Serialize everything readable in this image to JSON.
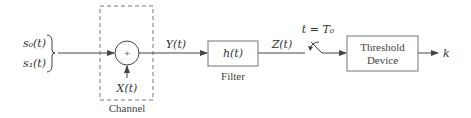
{
  "diagram": {
    "inputs": {
      "s0": "s₀(t)",
      "s1": "s₁(t)"
    },
    "channel": {
      "label": "Channel",
      "adder_symbol": "+",
      "noise": "X(t)"
    },
    "signal_after_channel": "Y(t)",
    "filter": {
      "transfer": "h(t)",
      "label": "Filter"
    },
    "filter_output": "Z(t)",
    "sampler": {
      "label": "t = T₀"
    },
    "threshold": {
      "line1": "Threshold",
      "line2": "Device"
    },
    "output": "k"
  }
}
